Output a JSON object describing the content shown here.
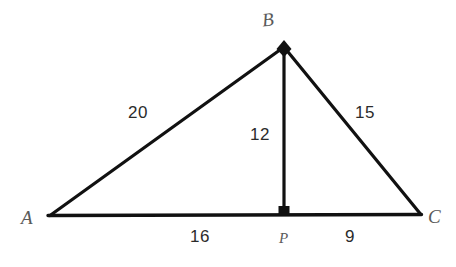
{
  "figure": {
    "type": "geometry-diagram",
    "shape": "triangle",
    "background_color": "#ffffff",
    "stroke_color": "#111111",
    "label_color": "#2b2b2b",
    "vertex_label_color": "#5a5a5a",
    "vertices": {
      "A": {
        "label": "A",
        "x": 50,
        "y": 215
      },
      "B": {
        "label": "B",
        "x": 284,
        "y": 46
      },
      "C": {
        "label": "C",
        "x": 420,
        "y": 214
      },
      "P": {
        "label": "P",
        "x": 284,
        "y": 215
      }
    },
    "segments": [
      {
        "name": "AB",
        "length_label": "20",
        "from": "A",
        "to": "B"
      },
      {
        "name": "BC",
        "length_label": "15",
        "from": "B",
        "to": "C"
      },
      {
        "name": "BP",
        "length_label": "12",
        "from": "B",
        "to": "P"
      },
      {
        "name": "AP",
        "length_label": "16",
        "from": "A",
        "to": "P"
      },
      {
        "name": "PC",
        "length_label": "9",
        "from": "P",
        "to": "C"
      }
    ],
    "markers": {
      "right_angle_at": "P",
      "vertex_dot_at": "B"
    },
    "labels": {
      "side_ab": "20",
      "side_bc": "15",
      "altitude_bp": "12",
      "base_ap": "16",
      "base_pc": "9",
      "vertex_a": "A",
      "vertex_b": "B",
      "vertex_c": "C",
      "foot_p": "P"
    }
  }
}
